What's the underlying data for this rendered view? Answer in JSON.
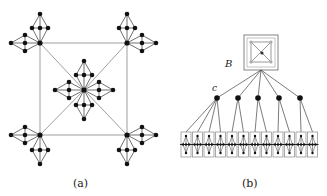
{
  "panels": [
    {
      "id": "a",
      "caption": "(a)",
      "description": "Square graph with a hub node at center, each corner and the center carrying attached diamond gadgets"
    },
    {
      "id": "b",
      "caption": "(b)",
      "description": "Tree: box B containing a small graph, five child nodes (first labeled c), each connected to leaf boxes"
    }
  ],
  "labels": {
    "box": "B",
    "node": "c"
  },
  "colors": {
    "node": "#111111",
    "edge": "#777777",
    "box": "#888888",
    "inner_node": "#999999"
  },
  "panel_b": {
    "mid_nodes": 5,
    "leaf_boxes": 12
  }
}
